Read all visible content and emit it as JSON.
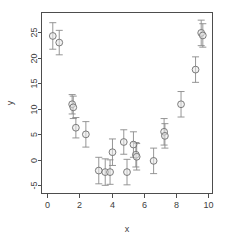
{
  "chart_data": {
    "type": "scatter",
    "title": "",
    "subtitle": "",
    "xlabel": "x",
    "ylabel": "y",
    "xlim": [
      -0.35,
      10.25
    ],
    "ylim": [
      -6.6,
      28.9
    ],
    "xticks": [
      0,
      2,
      4,
      6,
      8,
      10
    ],
    "xtick_labels": [
      "0",
      "2",
      "4",
      "6",
      "8",
      "10"
    ],
    "yticks": [
      -5,
      0,
      5,
      10,
      15,
      20,
      25
    ],
    "ytick_labels": [
      "-5",
      "0",
      "5",
      "10",
      "15",
      "20",
      "25"
    ],
    "grid": false,
    "legend": false,
    "legend_position": "none",
    "box": "L-shaped axes with full enclosing frame",
    "marker": {
      "shape": "open-circle",
      "radius_px": 3.4,
      "edge_color": "#6e6e6e",
      "fill_color": "#e8e8e8"
    },
    "errorbar_style": {
      "color": "#8a8a8a",
      "cap_width_px": 7,
      "orientation": "vertical"
    },
    "series": [
      {
        "name": "observations",
        "type": "scatter-with-errorbars",
        "x": [
          0.35,
          0.75,
          1.55,
          1.62,
          1.78,
          2.4,
          3.2,
          3.6,
          3.9,
          4.05,
          4.75,
          4.95,
          5.35,
          5.5,
          5.55,
          6.6,
          7.25,
          7.3,
          8.3,
          9.2,
          9.55,
          9.65
        ],
        "y": [
          24.3,
          23.0,
          10.9,
          10.3,
          6.3,
          5.0,
          -2.1,
          -2.4,
          -2.4,
          1.5,
          3.5,
          -2.4,
          3.0,
          1.0,
          0.6,
          -0.2,
          5.5,
          4.7,
          10.9,
          17.7,
          24.9,
          24.4
        ],
        "yerr": [
          2.6,
          2.4,
          1.9,
          2.2,
          2.0,
          2.5,
          2.6,
          2.6,
          2.4,
          2.6,
          2.4,
          2.5,
          2.5,
          2.4,
          2.6,
          2.5,
          2.6,
          2.4,
          2.5,
          2.5,
          2.5,
          2.3
        ]
      },
      {
        "name": "fitted quadratic curve",
        "type": "line",
        "color": "#000000",
        "equation": "y = 1.20*(x - 4.90)^2 - 1.60",
        "vertex": [
          4.9,
          -1.6
        ],
        "x": [
          0.0,
          0.5,
          1.0,
          1.5,
          2.0,
          2.5,
          3.0,
          3.5,
          4.0,
          4.5,
          5.0,
          5.5,
          6.0,
          6.5,
          7.0,
          7.5,
          8.0,
          8.5,
          9.0,
          9.5,
          10.0
        ],
        "y": [
          27.2,
          21.8,
          17.1,
          12.9,
          9.4,
          5.4,
          2.9,
          0.8,
          -0.6,
          -1.4,
          -1.6,
          -1.2,
          -0.2,
          1.5,
          3.7,
          6.6,
          10.0,
          14.1,
          18.7,
          24.0,
          28.0
        ]
      }
    ]
  },
  "axes": {
    "x_axis_name": "x-axis",
    "y_axis_name": "y-axis"
  }
}
